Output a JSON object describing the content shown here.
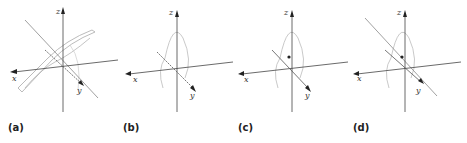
{
  "figure": {
    "panels": [
      {
        "label": "(a)",
        "description": "3D axes with two intersecting planes (curved sheet surfaces) and a line"
      },
      {
        "label": "(b)",
        "description": "3D axes with a sinusoidal curve in a vertical plane"
      },
      {
        "label": "(c)",
        "description": "3D axes with sinusoidal curve and a marked point"
      },
      {
        "label": "(d)",
        "description": "3D axes with sinusoidal curve, marked point, and a line parallel to y-axis"
      }
    ],
    "axes": {
      "x": "x",
      "y": "y",
      "z": "z"
    },
    "colors": {
      "axis": "#444444",
      "curve": "#bbbbbb",
      "line": "#888888",
      "point": "#222222"
    }
  }
}
